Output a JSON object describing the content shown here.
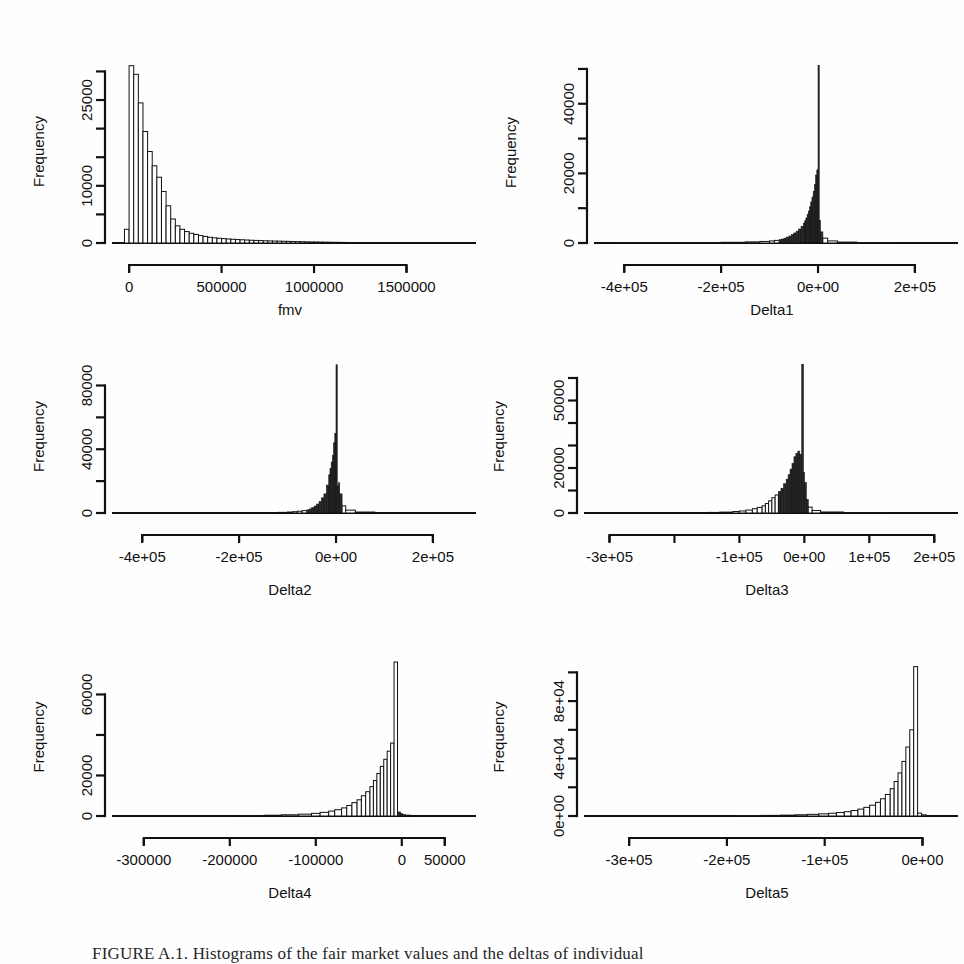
{
  "figure": {
    "caption": "FIGURE A.1. Histograms of the fair market values and the deltas of individual",
    "background_color": "#fefefe",
    "ink_color": "#111111"
  },
  "chart_data": [
    {
      "type": "bar",
      "panel_index": 0,
      "panel_position": "top-left",
      "title": "",
      "xlabel": "fmv",
      "ylabel": "Frequency",
      "xlim": [
        -60000,
        1800000
      ],
      "ylim": [
        0,
        32000
      ],
      "xticks": [
        0,
        500000,
        1000000,
        1500000
      ],
      "xtick_labels": [
        "0",
        "500000",
        "1000000",
        "1500000"
      ],
      "yticks": [
        0,
        10000,
        25000
      ],
      "ytick_labels": [
        "0",
        "10000",
        "25000"
      ],
      "ytick_all": [
        0,
        5000,
        10000,
        15000,
        20000,
        25000,
        30000
      ],
      "grid": false,
      "legend": "none",
      "bin_width": 25000,
      "bin_starts": [
        -25000,
        0,
        25000,
        50000,
        75000,
        100000,
        125000,
        150000,
        175000,
        200000,
        225000,
        250000,
        275000,
        300000,
        325000,
        350000,
        375000,
        400000,
        425000,
        450000,
        475000,
        500000,
        525000,
        550000,
        575000,
        600000,
        625000,
        650000,
        675000,
        700000,
        725000,
        750000,
        775000,
        800000,
        825000,
        850000,
        875000,
        900000,
        925000,
        950000,
        975000,
        1000000,
        1025000,
        1050000,
        1075000,
        1100000,
        1125000,
        1150000,
        1175000,
        1200000
      ],
      "values": [
        2400,
        31000,
        29500,
        24500,
        19500,
        16000,
        13500,
        11500,
        9000,
        6500,
        4200,
        3000,
        2400,
        2000,
        1700,
        1500,
        1300,
        1150,
        1000,
        900,
        820,
        760,
        700,
        650,
        600,
        560,
        520,
        480,
        450,
        420,
        390,
        360,
        340,
        320,
        300,
        280,
        260,
        240,
        220,
        200,
        185,
        170,
        155,
        140,
        130,
        120,
        110,
        100,
        90,
        80
      ]
    },
    {
      "type": "bar",
      "panel_index": 1,
      "panel_position": "top-right",
      "title": "",
      "xlabel": "Delta1",
      "ylabel": "Frequency",
      "xlim": [
        -450000,
        260000
      ],
      "ylim": [
        0,
        52000
      ],
      "xticks": [
        -400000,
        -200000,
        0,
        200000
      ],
      "xtick_labels": [
        "-4e+05",
        "-2e+05",
        "0e+00",
        "2e+05"
      ],
      "yticks": [
        0,
        20000,
        40000
      ],
      "ytick_labels": [
        "0",
        "20000",
        "40000"
      ],
      "ytick_all": [
        0,
        10000,
        20000,
        30000,
        40000,
        50000
      ],
      "grid": false,
      "legend": "none",
      "bin_width": 5000,
      "bin_starts": [
        -420000,
        -200000,
        -150000,
        -120000,
        -100000,
        -90000,
        -80000,
        -75000,
        -70000,
        -65000,
        -60000,
        -55000,
        -50000,
        -45000,
        -40000,
        -35000,
        -30000,
        -27500,
        -25000,
        -22500,
        -20000,
        -17500,
        -15000,
        -12500,
        -10000,
        -7500,
        -5000,
        -2500,
        0,
        2500,
        5000,
        10000,
        20000,
        40000,
        80000,
        150000
      ],
      "values": [
        120,
        200,
        320,
        450,
        600,
        750,
        950,
        1150,
        1400,
        1700,
        2000,
        2400,
        2900,
        3400,
        4000,
        4800,
        5700,
        6400,
        7200,
        8200,
        9200,
        10400,
        11800,
        13200,
        14800,
        16800,
        19500,
        21000,
        51000,
        6500,
        3200,
        1400,
        600,
        260,
        120,
        60
      ]
    },
    {
      "type": "bar",
      "panel_index": 2,
      "panel_position": "middle-left",
      "title": "",
      "xlabel": "Delta2",
      "ylabel": "Frequency",
      "xlim": [
        -450000,
        260000
      ],
      "ylim": [
        0,
        96000
      ],
      "xticks": [
        -400000,
        -200000,
        0,
        200000
      ],
      "xtick_labels": [
        "-4e+05",
        "-2e+05",
        "0e+00",
        "2e+05"
      ],
      "yticks": [
        0,
        40000,
        80000
      ],
      "ytick_labels": [
        "0",
        "40000",
        "80000"
      ],
      "ytick_all": [
        0,
        20000,
        40000,
        60000,
        80000
      ],
      "grid": false,
      "legend": "none",
      "bin_width": 5000,
      "bin_starts": [
        -300000,
        -200000,
        -150000,
        -120000,
        -100000,
        -90000,
        -80000,
        -70000,
        -60000,
        -55000,
        -50000,
        -45000,
        -40000,
        -35000,
        -30000,
        -25000,
        -20000,
        -15000,
        -12500,
        -10000,
        -7500,
        -5000,
        -2500,
        0,
        2500,
        5000,
        7500,
        12500,
        20000,
        40000,
        80000
      ],
      "values": [
        90,
        150,
        250,
        400,
        600,
        800,
        1100,
        1500,
        2000,
        2600,
        3400,
        4400,
        5600,
        7200,
        9500,
        12000,
        17500,
        24000,
        28000,
        32000,
        36000,
        44000,
        50000,
        93000,
        17000,
        19000,
        12000,
        4500,
        1800,
        600,
        200
      ]
    },
    {
      "type": "bar",
      "panel_index": 3,
      "panel_position": "middle-right",
      "title": "",
      "xlabel": "Delta3",
      "ylabel": "Frequency",
      "xlim": [
        -330000,
        215000
      ],
      "ylim": [
        0,
        68000
      ],
      "xticks": [
        -300000,
        -200000,
        -100000,
        0,
        100000,
        200000
      ],
      "xtick_labels": [
        "-3e+05",
        "-2e+05",
        "-1e+05",
        "0e+00",
        "1e+05",
        "2e+05"
      ],
      "xtick_labels_shown": [
        "-3e+05",
        "-1e+05",
        "0e+00",
        "1e+05",
        "2e+05"
      ],
      "yticks": [
        0,
        20000,
        50000
      ],
      "ytick_labels": [
        "0",
        "20000",
        "50000"
      ],
      "ytick_all": [
        0,
        10000,
        20000,
        30000,
        40000,
        50000,
        60000
      ],
      "grid": false,
      "legend": "none",
      "bin_width": 5000,
      "bin_starts": [
        -250000,
        -180000,
        -150000,
        -130000,
        -110000,
        -100000,
        -90000,
        -80000,
        -72500,
        -65000,
        -60000,
        -55000,
        -50000,
        -45000,
        -40000,
        -36000,
        -32000,
        -28000,
        -25000,
        -22000,
        -19000,
        -16000,
        -13000,
        -10000,
        -7000,
        -4000,
        -1500,
        0,
        3000,
        6000,
        12000,
        25000,
        60000,
        120000
      ],
      "values": [
        90,
        160,
        260,
        400,
        650,
        900,
        1300,
        1900,
        2500,
        3200,
        4200,
        5400,
        6800,
        8000,
        9500,
        11000,
        13000,
        15000,
        17000,
        19500,
        22000,
        25000,
        26500,
        27500,
        26000,
        66000,
        18000,
        13500,
        6000,
        2600,
        1100,
        450,
        180,
        80
      ]
    },
    {
      "type": "bar",
      "panel_index": 4,
      "panel_position": "bottom-left",
      "title": "",
      "xlabel": "Delta4",
      "ylabel": "Frequency",
      "xlim": [
        -330000,
        70000
      ],
      "ylim": [
        0,
        78000
      ],
      "xticks": [
        -300000,
        -200000,
        -100000,
        0,
        50000
      ],
      "xtick_labels": [
        "-300000",
        "-200000",
        "-100000",
        "0",
        "50000"
      ],
      "yticks": [
        0,
        20000,
        60000
      ],
      "ytick_labels": [
        "0",
        "20000",
        "60000"
      ],
      "ytick_all": [
        0,
        20000,
        40000,
        60000
      ],
      "grid": false,
      "legend": "none",
      "bin_width": 5000,
      "bin_starts": [
        -300000,
        -230000,
        -190000,
        -160000,
        -140000,
        -120000,
        -105000,
        -95000,
        -85000,
        -78000,
        -70000,
        -64000,
        -58000,
        -52000,
        -47000,
        -42000,
        -37000,
        -33000,
        -29000,
        -25000,
        -21000,
        -17000,
        -13000,
        -9000,
        -5000,
        -1500,
        1000,
        4000,
        10000,
        25000
      ],
      "values": [
        80,
        140,
        230,
        380,
        600,
        900,
        1300,
        1800,
        2400,
        3100,
        4000,
        5200,
        6600,
        8000,
        10000,
        12000,
        14500,
        17500,
        21000,
        24500,
        28000,
        32000,
        36000,
        76000,
        2000,
        1200,
        700,
        400,
        180,
        80
      ]
    },
    {
      "type": "bar",
      "panel_index": 5,
      "panel_position": "bottom-right",
      "title": "",
      "xlabel": "Delta5",
      "ylabel": "Frequency",
      "xlim": [
        -340000,
        22000
      ],
      "ylim": [
        0,
        110000
      ],
      "xticks": [
        -300000,
        -200000,
        -100000,
        0
      ],
      "xtick_labels": [
        "-3e+05",
        "-2e+05",
        "-1e+05",
        "0e+00"
      ],
      "yticks": [
        0,
        40000,
        80000
      ],
      "ytick_labels": [
        "0e+00",
        "4e+04",
        "8e+04"
      ],
      "ytick_all": [
        0,
        20000,
        40000,
        60000,
        80000,
        100000
      ],
      "grid": false,
      "legend": "none",
      "bin_width": 5000,
      "bin_starts": [
        -320000,
        -260000,
        -220000,
        -190000,
        -165000,
        -145000,
        -130000,
        -118000,
        -106000,
        -96000,
        -88000,
        -80000,
        -73000,
        -66000,
        -60000,
        -54000,
        -48000,
        -43000,
        -38000,
        -33000,
        -29000,
        -25000,
        -21000,
        -17000,
        -13000,
        -9000,
        -5000,
        -1000
      ],
      "values": [
        60,
        110,
        180,
        280,
        420,
        600,
        850,
        1150,
        1500,
        1900,
        2400,
        3000,
        3800,
        4800,
        6000,
        7500,
        9500,
        12000,
        15000,
        19000,
        24000,
        30000,
        38000,
        48000,
        60000,
        104000,
        2000,
        800
      ]
    }
  ]
}
